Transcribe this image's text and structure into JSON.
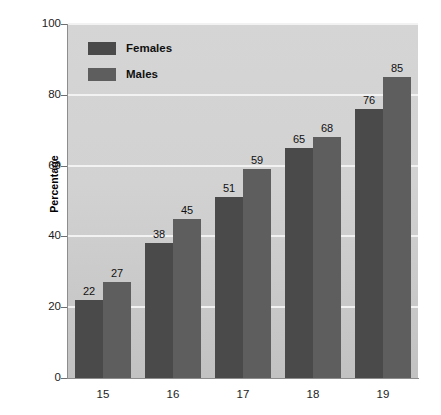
{
  "chart_data": {
    "type": "bar",
    "title": "",
    "subtitle": "",
    "xlabel": "",
    "ylabel": "Percentage",
    "categories": [
      "15",
      "16",
      "17",
      "18",
      "19"
    ],
    "series": [
      {
        "name": "Females",
        "values": [
          22,
          38,
          51,
          65,
          76
        ],
        "color": "#4a4a4a"
      },
      {
        "name": "Males",
        "values": [
          27,
          45,
          59,
          68,
          85
        ],
        "color": "#5e5e5e"
      }
    ],
    "ylim": [
      0,
      100
    ],
    "yticks": [
      0,
      20,
      40,
      60,
      80,
      100
    ],
    "ytick_labels": [
      "0",
      "20",
      "40",
      "60",
      "80",
      "100"
    ],
    "grid": true,
    "grid_axis": "y",
    "grid_color": "#f2f2f2",
    "legend_position": "top-left-inside",
    "data_labels": true,
    "plot_background": "#d2d2d2",
    "page_background": "#ffffff"
  },
  "legend": {
    "items": [
      {
        "label": "Females"
      },
      {
        "label": "Males"
      }
    ]
  },
  "axis": {
    "y_title": "Percentage"
  }
}
